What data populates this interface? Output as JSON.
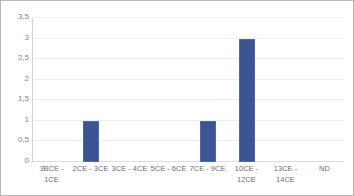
{
  "chart_data": {
    "type": "bar",
    "title": "",
    "subtitle": "",
    "xlabel": "",
    "ylabel": "",
    "categories": [
      "3BCE - 1CE",
      "2CE - 3CE",
      "3CE - 4CE",
      "5CE - 6CE",
      "7CE - 9CE",
      "10CE - 12CE",
      "13CE - 14CE",
      "ND"
    ],
    "values": [
      0,
      1,
      0,
      0,
      1,
      3,
      0,
      0
    ],
    "ylim": [
      0,
      3.5
    ],
    "ytick_labels": [
      "0",
      "0,5",
      "1",
      "1,5",
      "2",
      "2,5",
      "3",
      "3,5"
    ],
    "ytick_values": [
      0,
      0.5,
      1,
      1.5,
      2,
      2.5,
      3,
      3.5
    ],
    "grid": true,
    "legend": false,
    "legend_position": "none",
    "decimal_separator": ",",
    "bar_color": "#3b5494",
    "gridline_color": "#ededed",
    "axis_color": "#d4d4d4",
    "tick_label_color": "#838383",
    "category_label_color": "#6f6f6f",
    "frame_border_color": "#b9b9b9",
    "background_color": "#ffffff"
  }
}
